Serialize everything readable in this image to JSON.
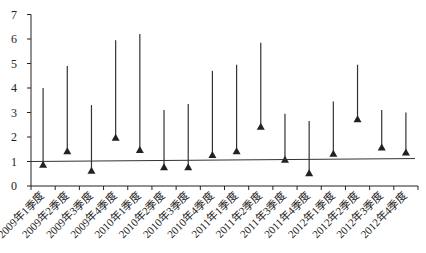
{
  "chart_data": {
    "type": "high-low",
    "title": "",
    "xlabel": "",
    "ylabel": "",
    "ylim": [
      0,
      7
    ],
    "yticks": [
      0,
      1,
      2,
      3,
      4,
      5,
      6,
      7
    ],
    "grid": false,
    "legend": null,
    "categories": [
      "2009年1季度",
      "2009年2季度",
      "2009年3季度",
      "2009年4季度",
      "2010年1季度",
      "2010年2季度",
      "2010年3季度",
      "2010年4季度",
      "2011年1季度",
      "2011年2季度",
      "2011年3季度",
      "2011年4季度",
      "2012年1季度",
      "2012年2季度",
      "2012年3季度",
      "2012年4季度"
    ],
    "series": [
      {
        "name": "high",
        "marker": "line-top",
        "values": [
          4.0,
          4.9,
          3.3,
          5.95,
          6.2,
          3.1,
          3.35,
          4.7,
          4.95,
          5.85,
          2.95,
          2.65,
          3.45,
          4.95,
          3.1,
          3.0
        ]
      },
      {
        "name": "low",
        "marker": "triangle",
        "values": [
          0.85,
          1.4,
          0.6,
          1.95,
          1.45,
          0.75,
          0.75,
          1.25,
          1.4,
          2.4,
          1.05,
          0.5,
          1.3,
          2.7,
          1.55,
          1.35
        ]
      }
    ],
    "reference_line": {
      "start": 1.0,
      "end": 1.12
    }
  },
  "colors": {
    "line": "#333333",
    "axis": "#222222"
  }
}
